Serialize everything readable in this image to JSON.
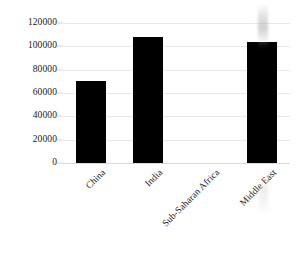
{
  "chart_data": {
    "type": "bar",
    "title": "",
    "subtitle": "",
    "xlabel": "",
    "ylabel": "",
    "categories": [
      "China",
      "India",
      "Sub-Saharan Africa",
      "Middle East"
    ],
    "values": [
      70000,
      108000,
      0,
      104000
    ],
    "series": [
      {
        "name": "",
        "values": [
          70000,
          108000,
          0,
          104000
        ]
      }
    ],
    "ylim": [
      0,
      120000
    ],
    "yticks": [
      0,
      20000,
      40000,
      60000,
      80000,
      100000,
      120000
    ],
    "ytick_labels": [
      "0",
      "20000",
      "40000",
      "60000",
      "80000",
      "100000",
      "120000"
    ],
    "grid": true,
    "grid_axis": "y",
    "legend": false,
    "legend_position": "none",
    "bar_color": "#000000",
    "gridline_color": "#e8e8e8",
    "background_color": "#ffffff",
    "text_color": "#1a1a1a",
    "xtick_rotation": -45,
    "annotations": []
  }
}
